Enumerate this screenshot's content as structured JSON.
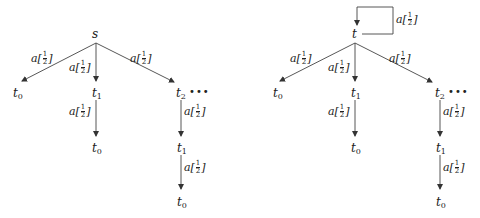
{
  "diagrams": [
    {
      "name": "left-tree",
      "root": "s",
      "root_self_loop": false,
      "nodes": [
        {
          "id": "s",
          "label": "s",
          "sub": ""
        },
        {
          "id": "l_t0",
          "label": "t",
          "sub": "0"
        },
        {
          "id": "l_t1",
          "label": "t",
          "sub": "1"
        },
        {
          "id": "l_t2",
          "label": "t",
          "sub": "2"
        },
        {
          "id": "l_t1_t0",
          "label": "t",
          "sub": "0"
        },
        {
          "id": "l_t2_t1",
          "label": "t",
          "sub": "1"
        },
        {
          "id": "l_t2_t1_t0",
          "label": "t",
          "sub": "0"
        }
      ],
      "edges": [
        {
          "from": "s",
          "to": "t0",
          "action": "a",
          "prob_num": "1",
          "prob_den": "2"
        },
        {
          "from": "s",
          "to": "t1",
          "action": "a",
          "prob_num": "1",
          "prob_den": "2"
        },
        {
          "from": "s",
          "to": "t2",
          "action": "a",
          "prob_num": "1",
          "prob_den": "2"
        },
        {
          "from": "t1",
          "to": "t0",
          "action": "a",
          "prob_num": "1",
          "prob_den": "2"
        },
        {
          "from": "t2",
          "to": "t1",
          "action": "a",
          "prob_num": "1",
          "prob_den": "2"
        },
        {
          "from": "t1",
          "to": "t0",
          "action": "a",
          "prob_num": "1",
          "prob_den": "2"
        }
      ],
      "ellipsis": "•••"
    },
    {
      "name": "right-tree",
      "root": "t",
      "root_self_loop": true,
      "nodes": [
        {
          "id": "t",
          "label": "t",
          "sub": ""
        },
        {
          "id": "r_t0",
          "label": "t",
          "sub": "0"
        },
        {
          "id": "r_t1",
          "label": "t",
          "sub": "1"
        },
        {
          "id": "r_t2",
          "label": "t",
          "sub": "2"
        },
        {
          "id": "r_t1_t0",
          "label": "t",
          "sub": "0"
        },
        {
          "id": "r_t2_t1",
          "label": "t",
          "sub": "1"
        },
        {
          "id": "r_t2_t1_t0",
          "label": "t",
          "sub": "0"
        }
      ],
      "edges": [
        {
          "from": "t",
          "to": "t",
          "action": "a",
          "prob_num": "1",
          "prob_den": "2"
        },
        {
          "from": "t",
          "to": "t0",
          "action": "a",
          "prob_num": "1",
          "prob_den": "2"
        },
        {
          "from": "t",
          "to": "t1",
          "action": "a",
          "prob_num": "1",
          "prob_den": "2"
        },
        {
          "from": "t",
          "to": "t2",
          "action": "a",
          "prob_num": "1",
          "prob_den": "2"
        },
        {
          "from": "t1",
          "to": "t0",
          "action": "a",
          "prob_num": "1",
          "prob_den": "2"
        },
        {
          "from": "t2",
          "to": "t1",
          "action": "a",
          "prob_num": "1",
          "prob_den": "2"
        },
        {
          "from": "t1",
          "to": "t0",
          "action": "a",
          "prob_num": "1",
          "prob_den": "2"
        }
      ],
      "ellipsis": "•••"
    }
  ],
  "label_parts": {
    "open": "[",
    "close": "]"
  }
}
